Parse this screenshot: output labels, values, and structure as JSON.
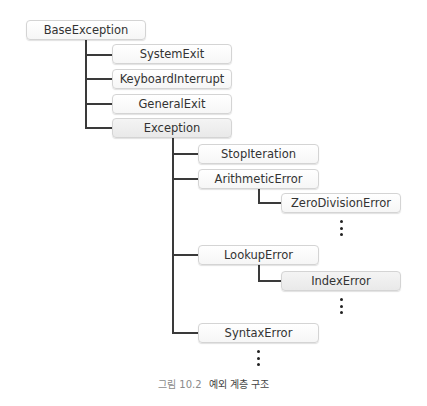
{
  "diagram": {
    "type": "tree",
    "root": {
      "label": "BaseException",
      "children": [
        {
          "label": "SystemExit"
        },
        {
          "label": "KeyboardInterrupt"
        },
        {
          "label": "GeneralExit"
        },
        {
          "label": "Exception",
          "children": [
            {
              "label": "StopIteration"
            },
            {
              "label": "ArithmeticError",
              "children": [
                {
                  "label": "ZeroDivisionError"
                }
              ],
              "more": true
            },
            {
              "label": "LookupError",
              "children": [
                {
                  "label": "IndexError"
                }
              ],
              "more": true
            },
            {
              "label": "SyntaxError"
            }
          ],
          "more": true
        }
      ]
    }
  },
  "nodes": {
    "base_exception": "BaseException",
    "system_exit": "SystemExit",
    "keyboard_interrupt": "KeyboardInterrupt",
    "general_exit": "GeneralExit",
    "exception": "Exception",
    "stop_iteration": "StopIteration",
    "arithmetic_error": "ArithmeticError",
    "zero_division_error": "ZeroDivisionError",
    "lookup_error": "LookupError",
    "index_error": "IndexError",
    "syntax_error": "SyntaxError"
  },
  "caption": {
    "figure_number": "그림 10.2",
    "title": "예외 계층 구조"
  },
  "colors": {
    "line": "#3a3a3a",
    "node_border": "#d4d4d4",
    "text": "#333333",
    "caption_number": "#8a8a8a"
  }
}
